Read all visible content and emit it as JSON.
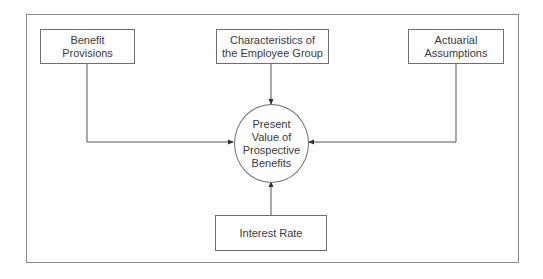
{
  "diagram": {
    "type": "flow",
    "center_node": {
      "id": "pvpb",
      "label": "Present\nValue of\nProspective\nBenefits",
      "shape": "circle"
    },
    "input_nodes": [
      {
        "id": "benefit_provisions",
        "label": "Benefit\nProvisions",
        "shape": "rectangle",
        "position": "top-left"
      },
      {
        "id": "employee_group",
        "label": "Characteristics of\nthe Employee Group",
        "shape": "rectangle",
        "position": "top-center"
      },
      {
        "id": "actuarial_assumptions",
        "label": "Actuarial\nAssumptions",
        "shape": "rectangle",
        "position": "top-right"
      },
      {
        "id": "interest_rate",
        "label": "Interest Rate",
        "shape": "rectangle",
        "position": "bottom-center"
      }
    ],
    "edges": [
      {
        "from": "benefit_provisions",
        "to": "pvpb",
        "arrow": "end"
      },
      {
        "from": "employee_group",
        "to": "pvpb",
        "arrow": "end"
      },
      {
        "from": "actuarial_assumptions",
        "to": "pvpb",
        "arrow": "end"
      },
      {
        "from": "interest_rate",
        "to": "pvpb",
        "arrow": "end"
      }
    ],
    "colors": {
      "stroke": "#6e6e6e",
      "frame": "#8a8a8a",
      "text": "#3a3a3a",
      "background": "#ffffff"
    }
  }
}
